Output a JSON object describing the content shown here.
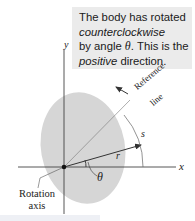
{
  "figure": {
    "callout": {
      "line1": "The body has rotated",
      "line2_italic": "counterclockwise",
      "line3_prefix": "by angle ",
      "line3_symbol": "θ",
      "line3_suffix": ". This is the",
      "line4_italic": "positive",
      "line4_suffix": " direction."
    },
    "labels": {
      "y_axis": "y",
      "x_axis": "x",
      "reference_line": "Reference line",
      "reference_line_word1": "Reference",
      "reference_line_word2": "line",
      "arc_length": "s",
      "radius": "r",
      "angle": "θ",
      "rotation_axis_line1": "Rotation",
      "rotation_axis_line2": "axis"
    },
    "colors": {
      "body_fill": "#d6d6d6",
      "callout_bg": "#ebebeb",
      "line": "#333333"
    }
  }
}
